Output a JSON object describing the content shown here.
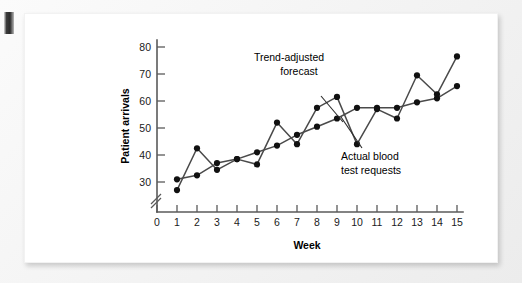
{
  "figure": {
    "background_color": "#ffffff",
    "scan_edge_mark": "page-edge-bleed"
  },
  "chart_data": {
    "type": "line",
    "title": "",
    "xlabel": "Week",
    "ylabel": "Patient arrivals",
    "x": [
      1,
      2,
      3,
      4,
      5,
      6,
      7,
      8,
      9,
      10,
      11,
      12,
      13,
      14,
      15
    ],
    "xlim": [
      0,
      15
    ],
    "ylim": [
      25,
      85
    ],
    "ytick_labels": [
      "30",
      "40",
      "50",
      "60",
      "70",
      "80"
    ],
    "ytick_values": [
      30,
      40,
      50,
      60,
      70,
      80
    ],
    "xtick_labels": [
      "0",
      "1",
      "2",
      "3",
      "4",
      "5",
      "6",
      "7",
      "8",
      "9",
      "10",
      "11",
      "12",
      "13",
      "14",
      "15"
    ],
    "xtick_values": [
      0,
      1,
      2,
      3,
      4,
      5,
      6,
      7,
      8,
      9,
      10,
      11,
      12,
      13,
      14,
      15
    ],
    "grid": false,
    "axis_break": true,
    "legend_position": "annotations",
    "series": [
      {
        "name": "Trend-adjusted forecast",
        "color": "#4a4a4a",
        "marker": "filled-circle",
        "values": [
          31,
          32.5,
          37,
          38.5,
          41,
          43.5,
          47.5,
          50.5,
          53.5,
          57.5,
          57.5,
          57.5,
          59.5,
          61,
          65.5
        ]
      },
      {
        "name": "Actual blood test requests",
        "color": "#4a4a4a",
        "marker": "filled-circle",
        "values": [
          27,
          42.5,
          34.5,
          38.5,
          36.5,
          52,
          44,
          57.5,
          61.5,
          44,
          57,
          53.5,
          69.5,
          62.5,
          76.5
        ]
      }
    ],
    "annotations": [
      {
        "id": "trend-adjusted-forecast",
        "line1": "Trend-adjusted",
        "line2": "forecast"
      },
      {
        "id": "actual-blood-test-requests",
        "line1": "Actual blood",
        "line2": "test requests"
      }
    ]
  }
}
